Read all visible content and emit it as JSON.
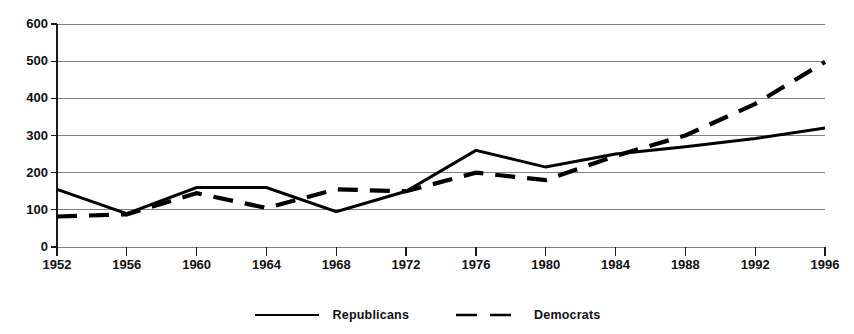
{
  "chart_data": {
    "type": "line",
    "title": "",
    "subtitle": "",
    "xlabel": "",
    "ylabel": "",
    "x": [
      1952,
      1956,
      1960,
      1964,
      1968,
      1972,
      1976,
      1980,
      1984,
      1988,
      1992,
      1996
    ],
    "xtick_labels": [
      "1952",
      "1956",
      "1960",
      "1964",
      "1968",
      "1972",
      "1976",
      "1980",
      "1984",
      "1988",
      "1992",
      "1996"
    ],
    "ytick_labels": [
      "0",
      "100",
      "200",
      "300",
      "400",
      "500",
      "600"
    ],
    "yticks": [
      0,
      100,
      200,
      300,
      400,
      500,
      600
    ],
    "ylim": [
      0,
      600
    ],
    "xlim": [
      1952,
      1996
    ],
    "grid": "horizontal",
    "legend_position": "bottom-center",
    "series": [
      {
        "name": "Republicans",
        "style": "solid",
        "color": "#000000",
        "values": [
          155,
          90,
          160,
          160,
          95,
          150,
          260,
          215,
          250,
          270,
          292,
          320
        ]
      },
      {
        "name": "Democrats",
        "style": "dashed",
        "color": "#000000",
        "values": [
          82,
          88,
          145,
          105,
          155,
          150,
          200,
          180,
          245,
          300,
          385,
          498
        ]
      }
    ]
  },
  "legend": {
    "items": [
      {
        "label": "Republicans",
        "style": "solid"
      },
      {
        "label": "Democrats",
        "style": "dashed"
      }
    ]
  },
  "colors": {
    "line": "#000000",
    "grid": "#808080",
    "axis": "#1a1a1a",
    "text": "#111111",
    "background": "#ffffff"
  }
}
